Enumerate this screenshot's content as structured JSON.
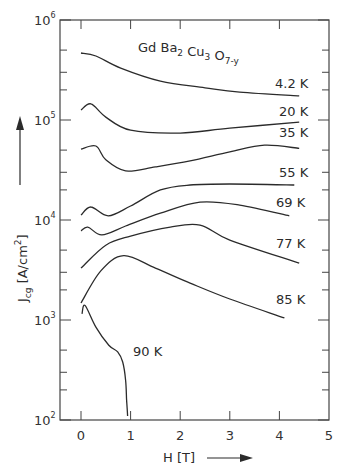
{
  "header_fragment": "ve Materials.",
  "chart_data": {
    "type": "line",
    "title_parts": {
      "base": [
        "Gd",
        "Ba",
        "Cu",
        "O"
      ],
      "subs": [
        "",
        "2",
        "3",
        "7-y"
      ]
    },
    "xlabel": "H [T]",
    "ylabel": "Jcg [A/cm²]",
    "ylabel_parts": {
      "main": "J",
      "sub": "cg",
      "unit": "[A/cm",
      "unit_sup": "2",
      "unit_close": "]"
    },
    "xscale": "linear",
    "yscale": "log",
    "xlim": [
      -0.4,
      5
    ],
    "ylim": [
      100,
      1000000
    ],
    "x_ticks": [
      0,
      1,
      2,
      3,
      4,
      5
    ],
    "x_tick_labels": [
      "0",
      "1",
      "2",
      "3",
      "4",
      "5"
    ],
    "y_ticks": [
      100,
      1000,
      10000,
      100000,
      1000000
    ],
    "y_tick_labels": [
      {
        "base": "10",
        "exp": "2"
      },
      {
        "base": "10",
        "exp": "3"
      },
      {
        "base": "10",
        "exp": "4"
      },
      {
        "base": "10",
        "exp": "5"
      },
      {
        "base": "10",
        "exp": "6"
      }
    ],
    "grid": false,
    "legend": "inline labels at right end of each curve",
    "series": [
      {
        "name": "4.2 K",
        "x": [
          0,
          0.3,
          0.8,
          1.6,
          2.5,
          3.2,
          4.4
        ],
        "y": [
          468000,
          437000,
          330000,
          245000,
          210000,
          190000,
          174000
        ]
      },
      {
        "name": "20 K",
        "x": [
          0,
          0.2,
          0.5,
          1.0,
          2.0,
          3.0,
          4.4
        ],
        "y": [
          126000,
          145000,
          107000,
          79000,
          74000,
          83000,
          95000
        ]
      },
      {
        "name": "35 K",
        "x": [
          0,
          0.3,
          0.5,
          0.9,
          1.5,
          2.2,
          3.0,
          3.7,
          4.4
        ],
        "y": [
          51000,
          55000,
          40000,
          31000,
          34000,
          39000,
          48000,
          56000,
          52000
        ]
      },
      {
        "name": "55 K",
        "x": [
          0,
          0.2,
          0.55,
          1.0,
          1.6,
          2.2,
          3.0,
          4.3
        ],
        "y": [
          11200,
          13500,
          11000,
          13800,
          20000,
          22400,
          22900,
          22400
        ]
      },
      {
        "name": "69 K",
        "x": [
          0,
          0.14,
          0.42,
          0.9,
          1.6,
          2.4,
          3.2,
          4.2
        ],
        "y": [
          7800,
          8500,
          7100,
          8700,
          11700,
          15100,
          14100,
          11000
        ]
      },
      {
        "name": "77 K",
        "x": [
          0,
          0.5,
          1.0,
          1.8,
          2.4,
          3.0,
          4.4
        ],
        "y": [
          3300,
          5600,
          6900,
          8500,
          8900,
          6300,
          3700
        ]
      },
      {
        "name": "85 K",
        "x": [
          0,
          0.4,
          0.86,
          1.5,
          2.2,
          3.0,
          4.1
        ],
        "y": [
          1480,
          3100,
          4400,
          3300,
          2340,
          1620,
          1050
        ]
      },
      {
        "name": "90 K",
        "x": [
          0.02,
          0.08,
          0.3,
          0.56,
          0.74,
          0.84,
          0.9,
          0.92,
          0.94
        ],
        "y": [
          1150,
          1400,
          850,
          560,
          480,
          380,
          250,
          158,
          110
        ]
      }
    ]
  }
}
